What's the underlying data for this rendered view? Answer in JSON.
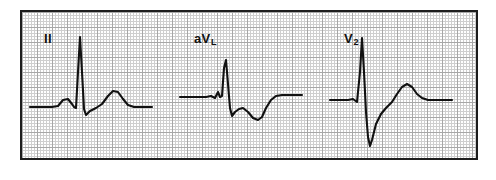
{
  "figure": {
    "kind": "ecg-rhythm-strip",
    "background_color": "#ffffff",
    "paper": {
      "border_color": "#1d1d1d",
      "grid_minor_color": "#cfcfcf",
      "grid_major_color": "#a7a7a7",
      "grid_minor_mm_px": 3,
      "grid_major_mm_px": 15
    },
    "trace_color": "#111111"
  },
  "leads": [
    {
      "id": "lead-ii",
      "label": "II",
      "label_sub": "",
      "baseline_y": 95,
      "description": "Sinus beat with upright P wave, tall narrow R wave, small S wave and broad upright T wave",
      "path": "M 8 95 L 30 95 L 36 94 L 41 88 L 46 87 L 50 92 L 52 95 L 54 96 L 56 60 L 58 25 L 60 60 L 62 97 L 64 103 L 68 99 L 74 96 L 80 92 L 86 84 L 91 79 L 96 80 L 101 87 L 106 93 L 112 95 L 130 95"
    },
    {
      "id": "lead-avl",
      "label": "aV",
      "label_sub": "L",
      "baseline_y": 85,
      "description": "Small notched r wave, deep S wave, and inverted (negative) T wave",
      "path": "M 8 85 L 34 85 L 39 84 L 43 86 L 46 80 L 48 85 L 50 84 L 52 56 L 54 48 L 56 72 L 58 96 L 60 104 L 63 100 L 67 97 L 71 96 L 76 100 L 81 106 L 86 108 L 90 105 L 94 96 L 99 88 L 104 84 L 110 83 L 130 83"
    },
    {
      "id": "lead-v2",
      "label": "V",
      "label_sub": "2",
      "baseline_y": 88,
      "description": "Tall R wave with very deep S wave descending below the baseline, followed by a prominent upright T wave",
      "path": "M 8 88 L 26 88 L 31 87 L 35 90 L 38 60 L 40 26 L 42 60 L 44 100 L 46 125 L 48 134 L 50 128 L 54 112 L 59 102 L 64 96 L 70 90 L 75 82 L 80 75 L 85 72 L 90 75 L 95 82 L 100 86 L 106 88 L 130 88"
    }
  ]
}
